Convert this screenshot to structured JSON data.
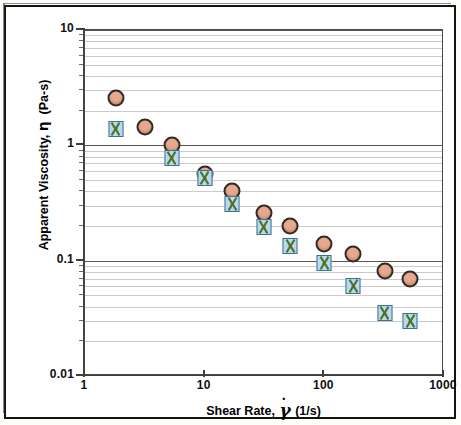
{
  "chart_data": {
    "type": "scatter",
    "title": "",
    "xlabel": "Shear Rate, γ̇ (1/s)",
    "xlabel_text": "Shear Rate,",
    "xlabel_units": "(1/s)",
    "ylabel": "Apparent Viscosity, η (Pa-s)",
    "ylabel_prefix": "Apparent Viscosity,",
    "ylabel_symbol": "η",
    "ylabel_units": "(Pa-s)",
    "xscale": "log",
    "yscale": "log",
    "xlim": [
      1,
      1000
    ],
    "ylim": [
      0.01,
      10
    ],
    "xticks": [
      1,
      10,
      100,
      1000
    ],
    "xtick_labels": [
      "1",
      "10",
      "100",
      "1000"
    ],
    "yticks": [
      0.01,
      0.1,
      1,
      10
    ],
    "ytick_labels": [
      "0.01",
      "0.1",
      "1",
      "10"
    ],
    "grid": "horizontal-log-minor",
    "legend": "none",
    "series": [
      {
        "name": "circle-series",
        "marker": "circle",
        "color": "#e6a88f",
        "edge_color": "#2f2a22",
        "x": [
          1.8,
          3.2,
          5.3,
          10,
          17,
          31,
          52,
          100,
          175,
          320,
          520
        ],
        "y": [
          2.6,
          1.45,
          1.0,
          0.57,
          0.4,
          0.26,
          0.2,
          0.14,
          0.115,
          0.082,
          0.07
        ]
      },
      {
        "name": "square-series",
        "marker": "square-x",
        "color": "#bcd8ee",
        "edge_color": "#3f6f96",
        "x_mark_color": "#3f7a23",
        "x": [
          1.8,
          5.3,
          10,
          17,
          31,
          52,
          100,
          175,
          320,
          520
        ],
        "y": [
          1.4,
          0.78,
          0.52,
          0.31,
          0.195,
          0.135,
          0.095,
          0.06,
          0.035,
          0.03
        ]
      }
    ]
  }
}
